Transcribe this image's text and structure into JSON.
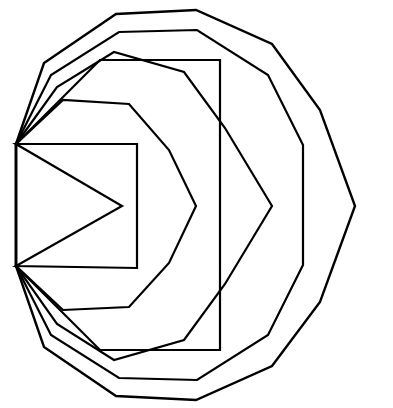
{
  "figure": {
    "background_color": "#ffffff",
    "stroke_color": "#000000",
    "canvas": {
      "width": 393,
      "height": 408
    },
    "shared_vertices": [
      {
        "name": "upper-hub",
        "x": 16,
        "y": 144
      },
      {
        "name": "lower-hub",
        "x": 16,
        "y": 266
      }
    ],
    "ring_count": 6,
    "rings": [
      {
        "name": "ring-1-innermost",
        "label": "Square with rightward chevron",
        "stroke_width": 2.2,
        "apex": {
          "x": 122,
          "y": 206
        },
        "points": "16,144 137,144 137,268 16,266 122,206"
      },
      {
        "name": "ring-2",
        "label": "Heptagonal ring",
        "stroke_width": 2.2,
        "apex": {
          "x": 196,
          "y": 206
        },
        "points": "16,144 63,100 129,104 169,150 196,206 169,263 129,307 63,310 16,266"
      },
      {
        "name": "ring-3",
        "label": "Octagonal ring with vertical right edge",
        "stroke_width": 2.2,
        "apex": {
          "x": 220,
          "y": 206
        },
        "points": "16,144 100,60 220,60 220,142 220,206 220,270 220,350 100,350 16,266"
      },
      {
        "name": "ring-4",
        "label": "Nonagonal ring",
        "stroke_width": 2.2,
        "apex": {
          "x": 272,
          "y": 206
        },
        "points": "16,144 57,87 114,52 184,72 225,128 272,206 225,284 184,340 114,360 57,324 16,266"
      },
      {
        "name": "ring-5",
        "label": "Decagonal ring with vertical right edge",
        "stroke_width": 2.2,
        "apex": {
          "x": 303,
          "y": 206
        },
        "points": "16,144 51,75 119,32 197,30 268,75 303,145 303,206 303,265 268,335 197,380 119,378 51,335 16,266"
      },
      {
        "name": "ring-6-outermost",
        "label": "Outer decagonal ring",
        "stroke_width": 2.4,
        "apex": {
          "x": 355,
          "y": 206
        },
        "points": "16,144 44,63 116,14 196,10 272,44 320,110 355,206 320,302 272,366 196,400 116,396 44,347 16,266"
      }
    ]
  }
}
